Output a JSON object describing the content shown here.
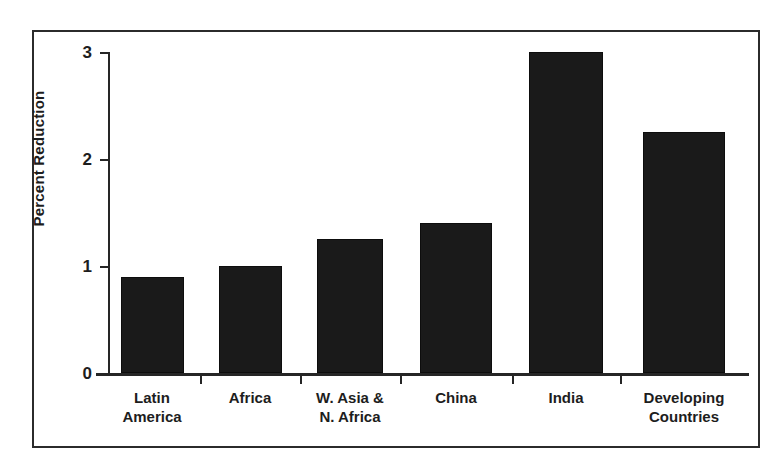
{
  "chart_data": {
    "type": "bar",
    "title": "",
    "subtitle": "",
    "xlabel": "",
    "ylabel": "Percent Reduction",
    "categories": [
      "Latin\nAmerica",
      "Africa",
      "W. Asia &\nN. Africa",
      "China",
      "India",
      "Developing\nCountries"
    ],
    "values": [
      0.9,
      1.0,
      1.25,
      1.4,
      3.0,
      2.25
    ],
    "ylim": [
      0,
      3
    ],
    "yticks": [
      0,
      1,
      2,
      3
    ],
    "ytick_labels": [
      "0",
      "1",
      "2",
      "3"
    ],
    "grid": false,
    "legend": null,
    "bar_color": "#1a1a1a",
    "axis_color": "#262626",
    "background_color": "#ffffff",
    "frame": true,
    "annotations": []
  },
  "figure": {
    "border_color": "#2b2b2b"
  }
}
